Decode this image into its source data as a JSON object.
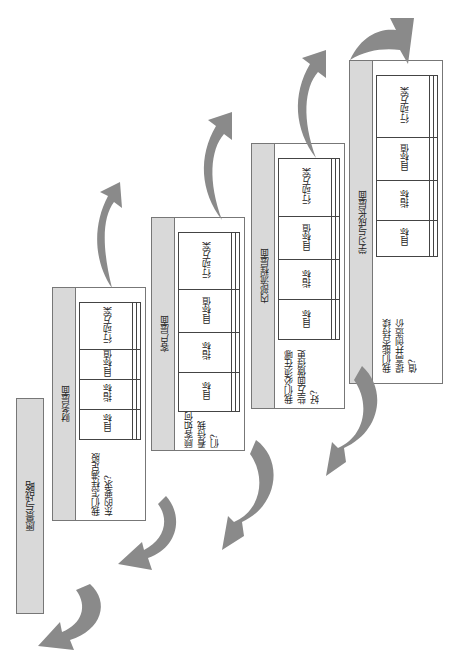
{
  "vision": {
    "label": "愿景与战略"
  },
  "panels": [
    {
      "id": "financial",
      "title": "财务层面",
      "question": "我们怎样满足股东的要求?",
      "columns": [
        "目标",
        "指标",
        "目标值",
        "行动方案"
      ]
    },
    {
      "id": "customer",
      "title": "客户层面",
      "question": "顾客如何看待我们?",
      "columns": [
        "目标",
        "指标",
        "目标值",
        "行动方案"
      ]
    },
    {
      "id": "internal",
      "title": "内部流程层面",
      "question": "我们必须在哪些方面做得更好?",
      "columns": [
        "目标",
        "指标",
        "目标值",
        "行动方案"
      ]
    },
    {
      "id": "learning",
      "title": "学习与成长层面",
      "question": "我们能否持续提高并创造价值?",
      "columns": [
        "目标",
        "指标",
        "目标值",
        "行动方案"
      ]
    }
  ],
  "colors": {
    "header_fill": "#d9d9d9",
    "arrow_fill": "#8a8a8a",
    "border": "#777777"
  }
}
